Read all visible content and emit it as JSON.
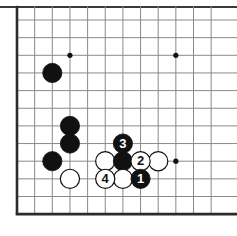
{
  "figure": {
    "kind": "go-board-diagram",
    "colors": {
      "black_stone": "#111111",
      "white_stone": "#ffffff",
      "stone_outline": "#111111",
      "grid_line": "#8a8a8a",
      "border_line": "#2b2b2b",
      "star_point": "#111111",
      "background": "#ffffff",
      "label_on_black": "#ffffff",
      "label_on_white": "#111111",
      "top_rule": "#3a3a3a"
    },
    "board": {
      "origin_x": 17,
      "origin_y": 20,
      "spacing": 17.65,
      "cols": 12,
      "rows": 12,
      "left_edge_thick": true,
      "bottom_edge_thick": true,
      "top_edge_open": true,
      "right_edge_open": true,
      "stone_radius": 9.6
    },
    "star_points": [
      {
        "name": "star-point-upper-left",
        "col": 3,
        "row": 2
      },
      {
        "name": "star-point-upper-right",
        "col": 9,
        "row": 2
      },
      {
        "name": "star-point-lower-right",
        "col": 9,
        "row": 8
      }
    ],
    "stones": [
      {
        "name": "black-stone-upper-left",
        "color": "black",
        "col": 2,
        "row": 3,
        "label": ""
      },
      {
        "name": "black-stone-left-upper-mid",
        "color": "black",
        "col": 3,
        "row": 6,
        "label": ""
      },
      {
        "name": "black-stone-left-lower-mid",
        "color": "black",
        "col": 3,
        "row": 7,
        "label": ""
      },
      {
        "name": "black-stone-left-edge",
        "color": "black",
        "col": 2,
        "row": 8,
        "label": ""
      },
      {
        "name": "white-stone-left-bottom",
        "color": "white",
        "col": 3,
        "row": 9,
        "label": ""
      },
      {
        "name": "white-stone-cluster-left",
        "color": "white",
        "col": 5,
        "row": 8,
        "label": ""
      },
      {
        "name": "black-stone-cluster-center",
        "color": "black",
        "col": 6,
        "row": 8,
        "label": ""
      },
      {
        "name": "white-stone-cluster-far-right",
        "color": "white",
        "col": 8,
        "row": 8,
        "label": ""
      },
      {
        "name": "white-stone-cluster-bottom-mid",
        "color": "white",
        "col": 6,
        "row": 9,
        "label": ""
      },
      {
        "name": "move-stone-3",
        "color": "black",
        "col": 6,
        "row": 7,
        "label": "3"
      },
      {
        "name": "move-stone-2",
        "color": "white",
        "col": 7,
        "row": 8,
        "label": "2"
      },
      {
        "name": "move-stone-4",
        "color": "white",
        "col": 5,
        "row": 9,
        "label": "4"
      },
      {
        "name": "move-stone-1",
        "color": "black",
        "col": 7,
        "row": 9,
        "label": "1"
      }
    ],
    "move_sequence": [
      {
        "number": "1",
        "color": "black"
      },
      {
        "number": "2",
        "color": "white"
      },
      {
        "number": "3",
        "color": "black"
      },
      {
        "number": "4",
        "color": "white"
      }
    ]
  }
}
